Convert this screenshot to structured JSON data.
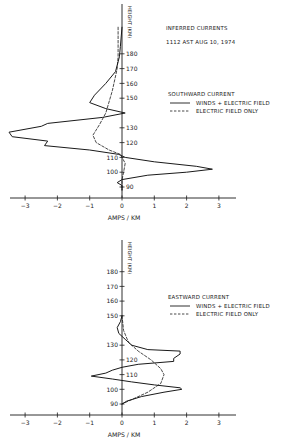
{
  "figure": {
    "background": "#ffffff",
    "ink": "#1a1a1a"
  },
  "chart_data": [
    {
      "type": "line",
      "id": "southward",
      "title": "INFERRED CURRENTS",
      "subtitle": "1112 AST   AUG 10, 1974",
      "legend_title": "SOUTHWARD CURRENT",
      "xlabel": "AMPS / KM",
      "ylabel": "HEIGHT (KM)",
      "xlim": [
        -3.5,
        3.5
      ],
      "ylim": [
        88,
        190
      ],
      "x_ticks": [
        -3,
        -2,
        -1,
        0,
        1,
        2,
        3
      ],
      "y_ticks": [
        90,
        100,
        110,
        120,
        130,
        150,
        160,
        170,
        180
      ],
      "grid": false,
      "legend_position": "right",
      "series": [
        {
          "name": "WINDS + ELECTRIC FIELD",
          "style": "solid",
          "points": [
            [
              0.0,
              198
            ],
            [
              -0.05,
              185
            ],
            [
              -0.08,
              178
            ],
            [
              -0.2,
              168
            ],
            [
              -0.5,
              160
            ],
            [
              -0.85,
              152
            ],
            [
              -1.0,
              147
            ],
            [
              -0.5,
              143
            ],
            [
              0.1,
              140
            ],
            [
              -0.6,
              137
            ],
            [
              -2.3,
              133
            ],
            [
              -2.5,
              131
            ],
            [
              -3.5,
              127
            ],
            [
              -3.4,
              124
            ],
            [
              -2.3,
              121
            ],
            [
              -2.4,
              118
            ],
            [
              -1.0,
              115
            ],
            [
              -0.1,
              112
            ],
            [
              0.1,
              110
            ],
            [
              1.0,
              107
            ],
            [
              2.3,
              104
            ],
            [
              2.8,
              102
            ],
            [
              2.0,
              100
            ],
            [
              0.8,
              98
            ],
            [
              0.0,
              95
            ],
            [
              -0.15,
              93
            ],
            [
              0.0,
              91
            ],
            [
              0.0,
              88
            ]
          ]
        },
        {
          "name": "ELECTRIC FIELD ONLY",
          "style": "dashed",
          "points": [
            [
              -0.12,
              198
            ],
            [
              -0.12,
              178
            ],
            [
              -0.15,
              170
            ],
            [
              -0.3,
              155
            ],
            [
              -0.5,
              140
            ],
            [
              -0.7,
              132
            ],
            [
              -0.9,
              125
            ],
            [
              -0.8,
              120
            ],
            [
              -0.4,
              115
            ],
            [
              -0.05,
              112
            ],
            [
              0.1,
              106
            ],
            [
              0.05,
              100
            ],
            [
              0.0,
              95
            ],
            [
              0.0,
              88
            ]
          ]
        }
      ]
    },
    {
      "type": "line",
      "id": "eastward",
      "title": "",
      "legend_title": "EASTWARD CURRENT",
      "xlabel": "AMPS / KM",
      "ylabel": "HEIGHT (KM)",
      "xlim": [
        -3.5,
        3.5
      ],
      "ylim": [
        88,
        190
      ],
      "x_ticks": [
        -3,
        -2,
        -1,
        0,
        1,
        2,
        3
      ],
      "y_ticks": [
        90,
        100,
        110,
        120,
        130,
        150,
        160,
        170,
        180
      ],
      "grid": false,
      "legend_position": "right",
      "series": [
        {
          "name": "WINDS + ELECTRIC FIELD",
          "style": "solid",
          "points": [
            [
              0.0,
              150
            ],
            [
              -0.05,
              146
            ],
            [
              -0.15,
              142
            ],
            [
              -0.1,
              138
            ],
            [
              0.1,
              134
            ],
            [
              0.3,
              130
            ],
            [
              0.8,
              127
            ],
            [
              1.8,
              126
            ],
            [
              1.8,
              124
            ],
            [
              1.6,
              121
            ],
            [
              1.6,
              119
            ],
            [
              0.5,
              117
            ],
            [
              0.0,
              115
            ],
            [
              -0.3,
              113
            ],
            [
              -0.5,
              111
            ],
            [
              -0.95,
              109
            ],
            [
              -0.3,
              107
            ],
            [
              0.3,
              105
            ],
            [
              1.0,
              103
            ],
            [
              1.8,
              101
            ],
            [
              1.85,
              100
            ],
            [
              1.3,
              98
            ],
            [
              0.6,
              95
            ],
            [
              0.15,
              92
            ],
            [
              0.0,
              90
            ]
          ]
        },
        {
          "name": "ELECTRIC FIELD ONLY",
          "style": "dashed",
          "points": [
            [
              0.0,
              150
            ],
            [
              0.05,
              140
            ],
            [
              0.2,
              132
            ],
            [
              0.5,
              126
            ],
            [
              0.9,
              120
            ],
            [
              1.2,
              114
            ],
            [
              1.3,
              110
            ],
            [
              1.2,
              104
            ],
            [
              0.8,
              98
            ],
            [
              0.3,
              93
            ],
            [
              0.0,
              90
            ]
          ]
        }
      ]
    }
  ],
  "panels": [
    {
      "id": "southward",
      "x0": 122,
      "pxPerAmp": 32.3,
      "yBase": 187,
      "hBase": 90,
      "pxPerKm": 1.48,
      "axisY": 198,
      "axisTopY": 4,
      "legend": {
        "x": 168,
        "titleY": 96,
        "row1Y": 105,
        "row2Y": 113
      },
      "title_pos": {
        "x": 166,
        "y1": 30,
        "y2": 44
      }
    },
    {
      "id": "eastward",
      "x0": 122,
      "pxPerAmp": 32.3,
      "yBase": 404,
      "hBase": 90,
      "pxPerKm": 1.47,
      "axisY": 415,
      "axisTopY": 240,
      "legend": {
        "x": 168,
        "titleY": 299,
        "row1Y": 308,
        "row2Y": 316
      }
    }
  ]
}
